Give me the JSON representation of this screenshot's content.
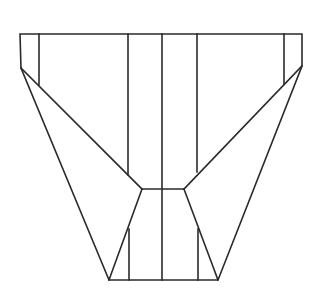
{
  "diagram": {
    "type": "line-drawing",
    "stroke_color": "#2a2a2a",
    "background_color": "#ffffff",
    "stroke_width": 1.6,
    "width": 314,
    "height": 307,
    "outline": {
      "points": [
        [
          20,
          34
        ],
        [
          302,
          34
        ],
        [
          302,
          66
        ],
        [
          218,
          280
        ],
        [
          109,
          280
        ],
        [
          21,
          68
        ]
      ]
    },
    "segments": [
      {
        "name": "left-flap-inner-vertical",
        "x1": 39,
        "y1": 34,
        "x2": 39,
        "y2": 85
      },
      {
        "name": "right-flap-inner-vertical",
        "x1": 284,
        "y1": 34,
        "x2": 284,
        "y2": 84
      },
      {
        "name": "left-fold-diagonal",
        "x1": 21,
        "y1": 68,
        "x2": 142,
        "y2": 189
      },
      {
        "name": "right-fold-diagonal",
        "x1": 302,
        "y1": 66,
        "x2": 184,
        "y2": 189
      },
      {
        "name": "left-center-vertical",
        "x1": 128,
        "y1": 34,
        "x2": 128,
        "y2": 175
      },
      {
        "name": "right-center-vertical",
        "x1": 197,
        "y1": 34,
        "x2": 197,
        "y2": 172
      },
      {
        "name": "middle-vertical",
        "x1": 162,
        "y1": 34,
        "x2": 162,
        "y2": 280
      },
      {
        "name": "waist-horizontal",
        "x1": 142,
        "y1": 189,
        "x2": 184,
        "y2": 189
      },
      {
        "name": "left-lower-diagonal",
        "x1": 142,
        "y1": 189,
        "x2": 109,
        "y2": 280
      },
      {
        "name": "right-lower-diagonal",
        "x1": 184,
        "y1": 189,
        "x2": 218,
        "y2": 280
      },
      {
        "name": "left-lower-vertical",
        "x1": 129,
        "y1": 229,
        "x2": 129,
        "y2": 280
      },
      {
        "name": "right-lower-vertical",
        "x1": 198,
        "y1": 229,
        "x2": 198,
        "y2": 280
      }
    ],
    "labels": []
  }
}
